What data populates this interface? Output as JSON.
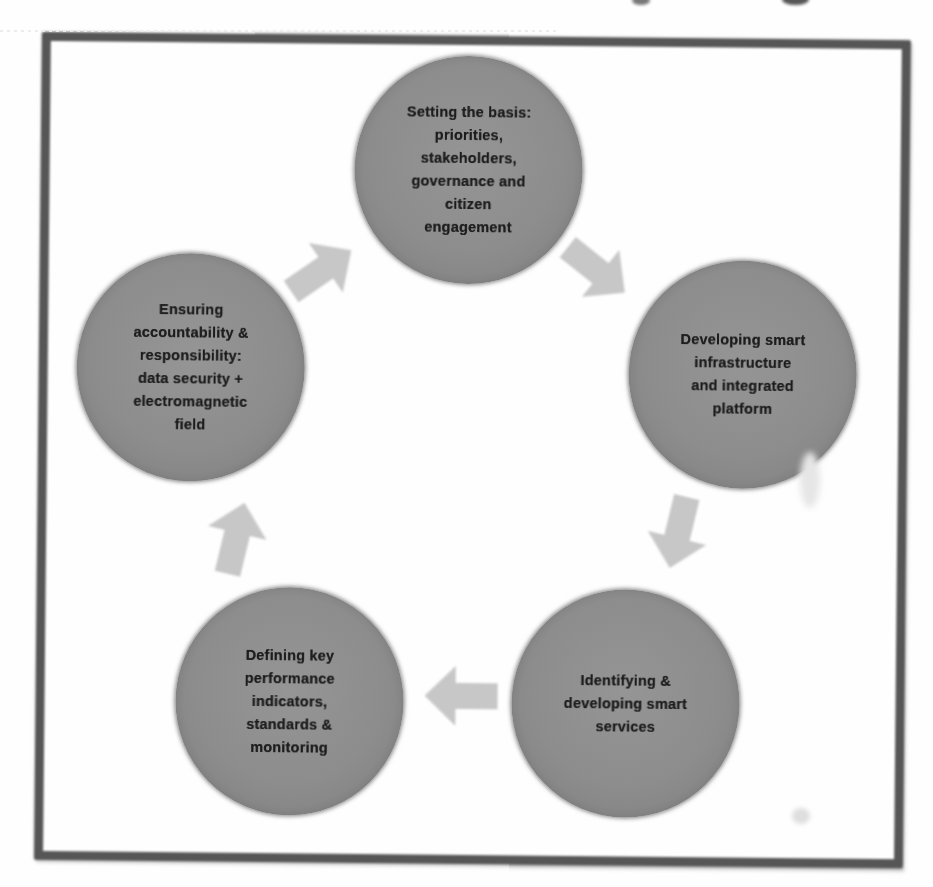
{
  "colors": {
    "page_background": "#fefefe",
    "frame_border": "#565656",
    "circle_fill": "#8d8d8d",
    "arrow_fill": "#c7c7c7",
    "text": "#1c1c1c"
  },
  "cycle": {
    "steps": [
      {
        "name": "setting-the-basis",
        "position": "top",
        "lines": [
          "Setting the basis:",
          "priorities,",
          "stakeholders,",
          "governance and",
          "citizen",
          "engagement"
        ]
      },
      {
        "name": "developing-smart-infrastructure",
        "position": "right",
        "lines": [
          "Developing smart",
          "infrastructure",
          "and integrated",
          "platform"
        ]
      },
      {
        "name": "identifying-developing-smart-services",
        "position": "bottom-right",
        "lines": [
          "Identifying &",
          "developing smart",
          "services"
        ]
      },
      {
        "name": "defining-key-performance-indicators",
        "position": "bottom-left",
        "lines": [
          "Defining key",
          "performance",
          "indicators,",
          "standards &",
          "monitoring"
        ]
      },
      {
        "name": "ensuring-accountability",
        "position": "left",
        "lines": [
          "Ensuring",
          "accountability &",
          "responsibility:",
          "data security +",
          "electromagnetic",
          "field"
        ]
      }
    ],
    "arrows": [
      {
        "name": "arrow-left-to-top",
        "direction": "up-right"
      },
      {
        "name": "arrow-top-to-right",
        "direction": "down-right"
      },
      {
        "name": "arrow-right-to-bottom-right",
        "direction": "down"
      },
      {
        "name": "arrow-bottom-right-to-bottom-left",
        "direction": "left"
      },
      {
        "name": "arrow-bottom-left-to-left",
        "direction": "up"
      }
    ]
  }
}
